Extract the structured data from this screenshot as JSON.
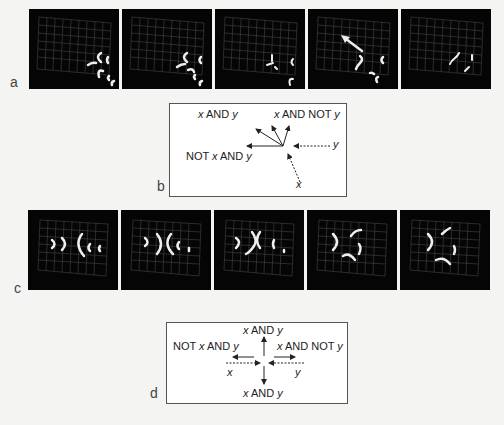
{
  "panels": {
    "a": {
      "label": "a",
      "frame_count": 5
    },
    "b": {
      "label": "b",
      "outputs": {
        "x_and_y": "x AND y",
        "x_and_not_y": "x AND NOT y",
        "not_x_and_y": "NOT x AND y"
      },
      "inputs": {
        "x": "x",
        "y": "y"
      }
    },
    "c": {
      "label": "c",
      "frame_count": 5
    },
    "d": {
      "label": "d",
      "outputs": {
        "x_and_y_top": "x AND y",
        "x_and_y_bottom": "x AND y",
        "not_x_and_y": "NOT x AND y",
        "x_and_not_y": "x AND NOT y"
      },
      "inputs": {
        "x": "x",
        "y": "y"
      }
    }
  },
  "colors": {
    "frame_bg": "#050505",
    "grid": "#4a4a4a",
    "glider": "#f0f0f0",
    "box_border": "#555555"
  }
}
